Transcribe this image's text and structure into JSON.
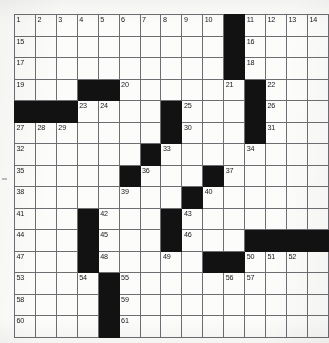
{
  "puzzle": {
    "kind": "crossword-grid",
    "title": "Crossword Puzzle Grid",
    "rows": 15,
    "columns": 15,
    "cell_size_px": 20.5,
    "colors": {
      "block": "#121212",
      "cell": "#fcfcfa",
      "grid_line": "#6d6e72",
      "number_text": "#16171a",
      "page_background": "#fdfdfb"
    },
    "total_clue_numbers": 61,
    "cells": [
      [
        {
          "n": "1"
        },
        {
          "n": "2"
        },
        {
          "n": "3"
        },
        {
          "n": "4"
        },
        {
          "n": "5"
        },
        {
          "n": "6"
        },
        {
          "n": "7"
        },
        {
          "n": "8"
        },
        {
          "n": "9"
        },
        {
          "n": "10"
        },
        {
          "block": true
        },
        {
          "n": "11"
        },
        {
          "n": "12"
        },
        {
          "n": "13"
        },
        {
          "n": "14"
        }
      ],
      [
        {
          "n": "15"
        },
        {},
        {},
        {},
        {},
        {},
        {},
        {},
        {},
        {},
        {
          "block": true
        },
        {
          "n": "16"
        },
        {},
        {},
        {}
      ],
      [
        {
          "n": "17"
        },
        {},
        {},
        {},
        {},
        {},
        {},
        {},
        {},
        {},
        {
          "block": true
        },
        {
          "n": "18"
        },
        {},
        {},
        {}
      ],
      [
        {
          "n": "19"
        },
        {},
        {},
        {
          "block": true
        },
        {
          "block": true
        },
        {
          "n": "20"
        },
        {},
        {},
        {},
        {},
        {
          "n": "21"
        },
        {
          "block": true
        },
        {
          "n": "22"
        },
        {},
        {}
      ],
      [
        {
          "block": true
        },
        {
          "block": true
        },
        {
          "block": true
        },
        {
          "n": "23"
        },
        {
          "n": "24"
        },
        {},
        {},
        {
          "block": true
        },
        {
          "n": "25"
        },
        {},
        {},
        {
          "block": true
        },
        {
          "n": "26"
        },
        {},
        {}
      ],
      [
        {
          "n": "27"
        },
        {
          "n": "28"
        },
        {
          "n": "29"
        },
        {},
        {},
        {},
        {},
        {
          "block": true
        },
        {
          "n": "30"
        },
        {},
        {},
        {
          "block": true
        },
        {
          "n": "31"
        },
        {},
        {}
      ],
      [
        {
          "n": "32"
        },
        {},
        {},
        {},
        {},
        {},
        {
          "block": true
        },
        {
          "n": "33"
        },
        {},
        {},
        {},
        {
          "n": "34"
        },
        {},
        {},
        {}
      ],
      [
        {
          "n": "35"
        },
        {},
        {},
        {},
        {},
        {
          "block": true
        },
        {
          "n": "36"
        },
        {},
        {},
        {
          "block": true
        },
        {
          "n": "37"
        },
        {},
        {},
        {},
        {}
      ],
      [
        {
          "n": "38"
        },
        {},
        {},
        {},
        {},
        {
          "n": "39"
        },
        {},
        {},
        {
          "block": true
        },
        {
          "n": "40"
        },
        {},
        {},
        {},
        {},
        {}
      ],
      [
        {
          "n": "41"
        },
        {},
        {},
        {
          "block": true
        },
        {
          "n": "42"
        },
        {},
        {},
        {
          "block": true
        },
        {
          "n": "43"
        },
        {},
        {},
        {},
        {},
        {},
        {}
      ],
      [
        {
          "n": "44"
        },
        {},
        {},
        {
          "block": true
        },
        {
          "n": "45"
        },
        {},
        {},
        {
          "block": true
        },
        {
          "n": "46"
        },
        {},
        {},
        {
          "block": true
        },
        {
          "block": true
        },
        {
          "block": true
        },
        {
          "block": true
        }
      ],
      [
        {
          "n": "47"
        },
        {},
        {},
        {
          "block": true
        },
        {
          "n": "48"
        },
        {},
        {},
        {
          "n": "49"
        },
        {},
        {
          "block": true
        },
        {
          "block": true
        },
        {
          "n": "50"
        },
        {
          "n": "51"
        },
        {
          "n": "52"
        },
        {}
      ],
      [
        {
          "n": "53"
        },
        {},
        {},
        {
          "n": "54"
        },
        {
          "block": true
        },
        {
          "n": "55"
        },
        {},
        {},
        {},
        {},
        {
          "n": "56"
        },
        {
          "n": "57"
        },
        {},
        {},
        {}
      ],
      [
        {
          "n": "58"
        },
        {},
        {},
        {},
        {
          "block": true
        },
        {
          "n": "59"
        },
        {},
        {},
        {},
        {},
        {},
        {},
        {},
        {},
        {}
      ],
      [
        {
          "n": "60"
        },
        {},
        {},
        {},
        {
          "block": true
        },
        {
          "n": "61"
        },
        {},
        {},
        {},
        {},
        {},
        {},
        {},
        {},
        {}
      ]
    ]
  }
}
